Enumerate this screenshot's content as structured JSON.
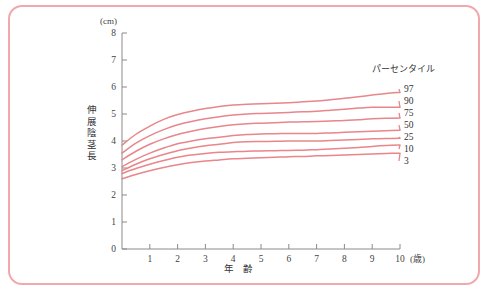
{
  "figure": {
    "border_color": "#f0a8ac",
    "background": "#ffffff"
  },
  "axes": {
    "y_unit_label": "(cm)",
    "y_axis_title": "伸展陰茎長",
    "x_axis_title": "年 齢",
    "x_unit_label": "(歳)",
    "y_ticks": [
      "0",
      "1",
      "2",
      "3",
      "4",
      "5",
      "6",
      "7",
      "8"
    ],
    "x_ticks": [
      "1",
      "2",
      "3",
      "4",
      "5",
      "6",
      "7",
      "8",
      "9",
      "10"
    ]
  },
  "legend": {
    "title": "パーセンタイル",
    "entries": [
      "97",
      "90",
      "75",
      "50",
      "25",
      "10",
      "3"
    ]
  },
  "chart_data": {
    "type": "line",
    "title": "",
    "xlabel": "年 齢",
    "ylabel": "伸展陰茎長",
    "x_unit": "歳",
    "y_unit": "cm",
    "xlim": [
      0,
      10
    ],
    "ylim": [
      0,
      8
    ],
    "grid": false,
    "legend_position": "right",
    "legend_title": "パーセンタイル",
    "line_color": "#e8868a",
    "x": [
      0,
      0.5,
      1,
      1.5,
      2,
      2.5,
      3,
      3.5,
      4,
      4.5,
      5,
      5.5,
      6,
      6.5,
      7,
      7.5,
      8,
      8.5,
      9,
      9.5,
      10
    ],
    "series": [
      {
        "name": "97",
        "values": [
          3.85,
          4.25,
          4.55,
          4.8,
          4.98,
          5.1,
          5.2,
          5.28,
          5.33,
          5.36,
          5.38,
          5.4,
          5.42,
          5.45,
          5.48,
          5.53,
          5.58,
          5.64,
          5.7,
          5.76,
          5.8
        ]
      },
      {
        "name": "90",
        "values": [
          3.55,
          3.92,
          4.2,
          4.42,
          4.6,
          4.72,
          4.82,
          4.9,
          4.96,
          5.0,
          5.02,
          5.04,
          5.06,
          5.08,
          5.1,
          5.14,
          5.18,
          5.22,
          5.25,
          5.25,
          5.25
        ]
      },
      {
        "name": "75",
        "values": [
          3.3,
          3.62,
          3.88,
          4.08,
          4.24,
          4.36,
          4.46,
          4.54,
          4.6,
          4.64,
          4.66,
          4.68,
          4.7,
          4.71,
          4.72,
          4.74,
          4.76,
          4.79,
          4.82,
          4.84,
          4.85
        ]
      },
      {
        "name": "50",
        "values": [
          3.05,
          3.32,
          3.55,
          3.74,
          3.9,
          4.0,
          4.08,
          4.14,
          4.2,
          4.24,
          4.26,
          4.27,
          4.28,
          4.28,
          4.28,
          4.3,
          4.32,
          4.34,
          4.36,
          4.38,
          4.4
        ]
      },
      {
        "name": "25",
        "values": [
          2.9,
          3.14,
          3.34,
          3.5,
          3.64,
          3.74,
          3.82,
          3.88,
          3.94,
          3.97,
          3.98,
          3.99,
          4.0,
          4.0,
          4.0,
          4.02,
          4.04,
          4.06,
          4.08,
          4.09,
          4.1
        ]
      },
      {
        "name": "10",
        "values": [
          2.8,
          2.98,
          3.14,
          3.28,
          3.4,
          3.48,
          3.54,
          3.58,
          3.6,
          3.62,
          3.63,
          3.64,
          3.65,
          3.66,
          3.68,
          3.7,
          3.73,
          3.76,
          3.8,
          3.83,
          3.85
        ]
      },
      {
        "name": "3",
        "values": [
          2.6,
          2.76,
          2.9,
          3.02,
          3.12,
          3.2,
          3.26,
          3.3,
          3.34,
          3.36,
          3.38,
          3.4,
          3.42,
          3.43,
          3.45,
          3.46,
          3.48,
          3.5,
          3.52,
          3.54,
          3.55
        ]
      }
    ]
  }
}
